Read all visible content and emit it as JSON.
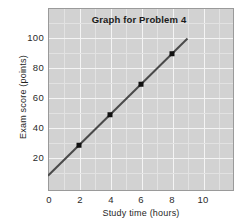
{
  "chart_data": {
    "type": "line",
    "title": "Graph for Problem 4",
    "xlabel": "Study time (hours)",
    "ylabel": "Exam score (points)",
    "xlim": [
      0,
      12
    ],
    "ylim": [
      0,
      120
    ],
    "xticks": [
      0,
      2,
      4,
      6,
      8,
      10
    ],
    "yticks": [
      20,
      40,
      60,
      80,
      100
    ],
    "xtick_labels": [
      "0",
      "2",
      "4",
      "6",
      "8",
      "10"
    ],
    "ytick_labels": [
      "20",
      "40",
      "60",
      "80",
      "100"
    ],
    "grid": true,
    "legend": "none",
    "series": [
      {
        "name": "Exam score vs study time",
        "x": [
          2,
          4,
          6,
          8
        ],
        "y": [
          30,
          50,
          70,
          90
        ],
        "marker": "square",
        "line_from": [
          0,
          10
        ],
        "line_to": [
          9,
          100
        ],
        "slope": 10,
        "intercept": 10,
        "color": "#4a4a4a",
        "marker_color": "#111111"
      }
    ],
    "annotations": []
  },
  "colors": {
    "plot_background": "#d2d2d2",
    "gridline": "#f4f4f4",
    "gridline_minor": "#e2e2e2",
    "plot_border": "#9a9a9a",
    "line": "#4a4a4a",
    "marker": "#111111",
    "text": "#1f1f1f",
    "page_background": "#ffffff"
  }
}
